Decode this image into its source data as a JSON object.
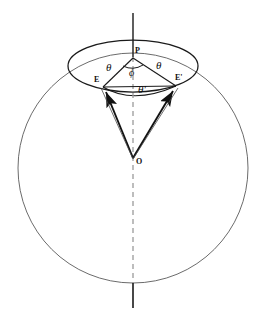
{
  "figure": {
    "kind": "geometry-diagram",
    "caption_absent": true,
    "background_color": "#ffffff",
    "stroke_color": "#1a1a1a",
    "thin_stroke_color": "#4a4a4a",
    "dash_color": "#8c8c8c",
    "canvas": {
      "width": 267,
      "height": 316
    }
  },
  "labels": {
    "apex": "O",
    "pole": "P",
    "point_e": "E",
    "point_e_prime": "E'",
    "angle_theta_left": "θ",
    "angle_theta_right": "θ",
    "angle_phi": "ϕ",
    "angle_theta_prime": "θ'"
  },
  "geometry": {
    "sphere": {
      "shape": "circle",
      "center_x": 133,
      "center_y": 168,
      "radius": 115
    },
    "small_circle": {
      "shape": "ellipse",
      "center_x": 133,
      "center_y": 66,
      "radius_x": 65,
      "radius_y": 26
    },
    "axis": {
      "top_solid": {
        "x": 133,
        "y1": 13,
        "y2": 57
      },
      "dashed": {
        "x": 133,
        "y1": 57,
        "y2": 283
      },
      "bottom_solid": {
        "x": 133,
        "y1": 283,
        "y2": 308
      }
    },
    "points": {
      "O": {
        "x": 133,
        "y": 159
      },
      "P": {
        "x": 133,
        "y": 57
      },
      "E": {
        "x": 103,
        "y": 87
      },
      "E_prime": {
        "x": 176,
        "y": 86
      }
    },
    "segments": [
      {
        "name": "P-E",
        "from": "P",
        "to": "E"
      },
      {
        "name": "P-E-prime",
        "from": "P",
        "to": "E_prime"
      },
      {
        "name": "O-E-vector",
        "from": "O",
        "to": "E",
        "arrow": true
      },
      {
        "name": "O-E-prime-vector",
        "from": "O",
        "to": "E_prime",
        "arrow": true
      },
      {
        "name": "E-E-prime-chord",
        "from": "E",
        "to": "E_prime"
      },
      {
        "name": "O-P-axis",
        "from": "O",
        "to": "P",
        "dashed": true
      }
    ]
  }
}
